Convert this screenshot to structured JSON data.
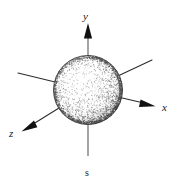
{
  "figure": {
    "type": "3d-coordinate-axes-with-sphere",
    "background_color": "#ffffff",
    "ink_color": "#1a1a1a",
    "vertical_axis_color": "#8e8e8e",
    "labels": {
      "y_axis": "y",
      "x_axis": "x",
      "z_axis": "z",
      "bottom": "s"
    },
    "sphere": {
      "center": {
        "x": 88,
        "y": 90
      },
      "radius": 35,
      "shading": "stippled",
      "fill_color": "#ffffff",
      "stipple_color": "#4a4a4a",
      "outline_color": "#3a3a3a"
    },
    "axes": [
      {
        "name": "y-axis",
        "label": "y",
        "direction": "up",
        "arrow": true,
        "from": {
          "x": 88,
          "y": 90
        },
        "to": {
          "x": 88,
          "y": 24
        }
      },
      {
        "name": "x-axis",
        "label": "x",
        "direction": "down-right",
        "arrow": true,
        "from": {
          "x": 88,
          "y": 90
        },
        "to": {
          "x": 155,
          "y": 106
        }
      },
      {
        "name": "z-axis",
        "label": "z",
        "direction": "down-left",
        "arrow": true,
        "from": {
          "x": 88,
          "y": 90
        },
        "to": {
          "x": 22,
          "y": 131
        }
      },
      {
        "name": "negative-x-axis",
        "label": "",
        "direction": "up-left",
        "arrow": false,
        "from": {
          "x": 88,
          "y": 90
        },
        "to": {
          "x": 18,
          "y": 73
        }
      },
      {
        "name": "negative-z-axis",
        "label": "",
        "direction": "up-right",
        "arrow": false,
        "from": {
          "x": 88,
          "y": 90
        },
        "to": {
          "x": 152,
          "y": 60
        }
      },
      {
        "name": "s-axis",
        "label": "s",
        "direction": "down",
        "arrow": false,
        "from": {
          "x": 88,
          "y": 90
        },
        "to": {
          "x": 88,
          "y": 156
        }
      }
    ],
    "label_positions": {
      "y": {
        "x": 84,
        "y": 20
      },
      "x": {
        "x": 163,
        "y": 111
      },
      "z": {
        "x": 11,
        "y": 137
      },
      "s": {
        "x": 85,
        "y": 176
      }
    }
  }
}
